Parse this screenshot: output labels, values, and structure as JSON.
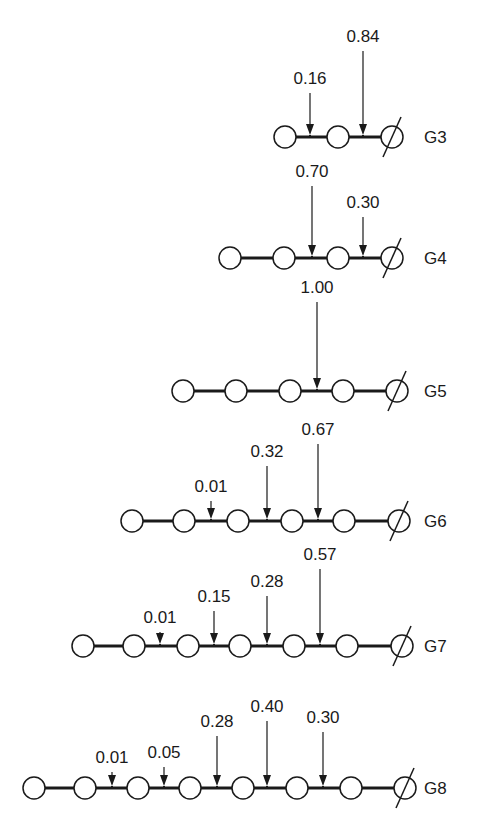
{
  "diagram": {
    "rows": [
      {
        "label": "G3",
        "y": 137,
        "nodes": [
          285,
          338,
          392
        ],
        "arrows": [
          {
            "x": 310,
            "value": "0.16",
            "label_y": 84
          },
          {
            "x": 363,
            "value": "0.84",
            "label_y": 42
          }
        ]
      },
      {
        "label": "G4",
        "y": 258,
        "nodes": [
          230,
          284,
          338,
          392
        ],
        "arrows": [
          {
            "x": 312,
            "value": "0.70",
            "label_y": 177
          },
          {
            "x": 363,
            "value": "0.30",
            "label_y": 208
          }
        ]
      },
      {
        "label": "G5",
        "y": 391,
        "nodes": [
          183,
          236,
          290,
          343,
          397
        ],
        "arrows": [
          {
            "x": 317,
            "value": "1.00",
            "label_y": 293
          }
        ]
      },
      {
        "label": "G6",
        "y": 521,
        "nodes": [
          132,
          184,
          238,
          292,
          344,
          399
        ],
        "arrows": [
          {
            "x": 211,
            "value": "0.01",
            "label_y": 492
          },
          {
            "x": 267,
            "value": "0.32",
            "label_y": 457
          },
          {
            "x": 318,
            "value": "0.67",
            "label_y": 435
          }
        ]
      },
      {
        "label": "G7",
        "y": 646,
        "nodes": [
          83,
          134,
          188,
          240,
          294,
          347,
          402
        ],
        "arrows": [
          {
            "x": 160,
            "value": "0.01",
            "label_y": 623
          },
          {
            "x": 214,
            "value": "0.15",
            "label_y": 602
          },
          {
            "x": 267,
            "value": "0.28",
            "label_y": 587
          },
          {
            "x": 320,
            "value": "0.57",
            "label_y": 560
          }
        ]
      },
      {
        "label": "G8",
        "y": 788,
        "nodes": [
          34,
          85,
          138,
          190,
          243,
          297,
          351,
          405
        ],
        "arrows": [
          {
            "x": 112,
            "value": "0.01",
            "label_y": 763
          },
          {
            "x": 164,
            "value": "0.05",
            "label_y": 758
          },
          {
            "x": 217,
            "value": "0.28",
            "label_y": 727
          },
          {
            "x": 267,
            "value": "0.40",
            "label_y": 712
          },
          {
            "x": 323,
            "value": "0.30",
            "label_y": 723
          }
        ]
      }
    ]
  }
}
